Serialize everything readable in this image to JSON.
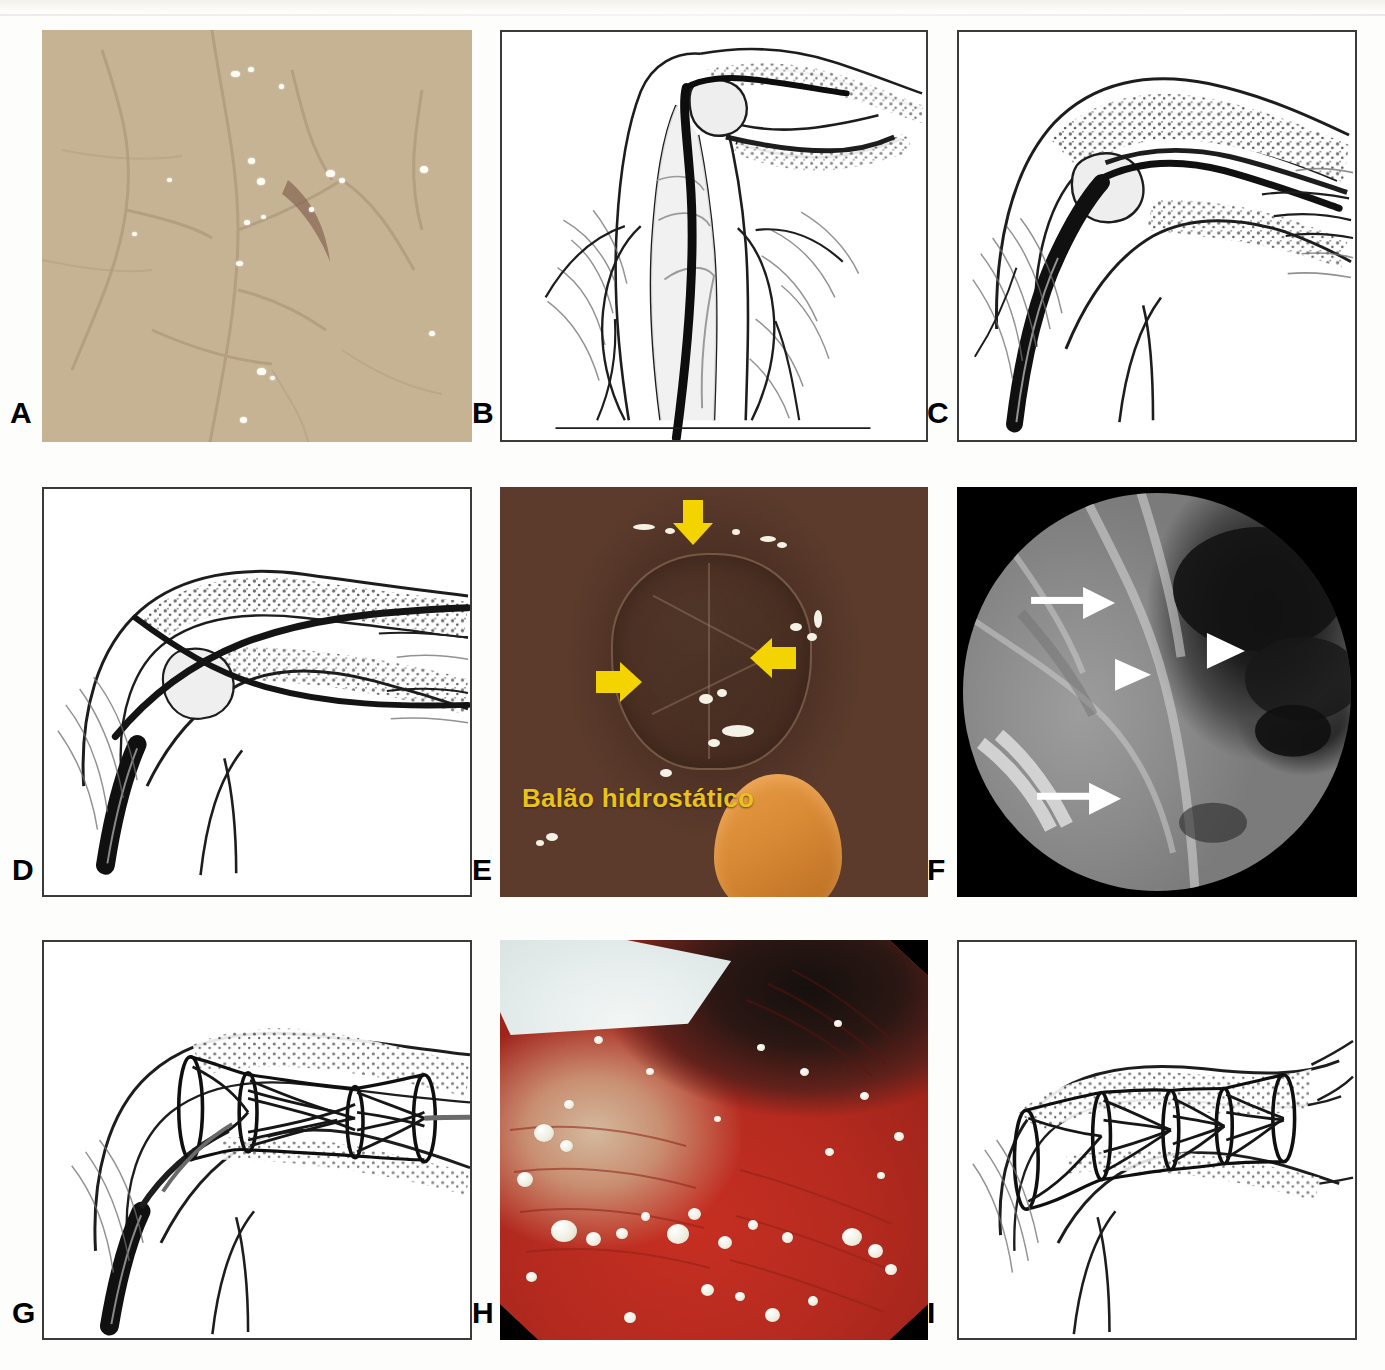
{
  "figure": {
    "layout": {
      "rows": 3,
      "columns": 3
    },
    "background_color": "#ffffff"
  },
  "panels": [
    {
      "id": "A",
      "label": "A",
      "kind": "endoscopic-photograph",
      "description": "Endoscopic view of pale tan duodenal mucosa with a central infiltrated papilla and scattered light reflections",
      "framed": false,
      "colors": {
        "mucosa": "#c5b394",
        "highlight": "#e7e2c4",
        "lumen": "#3c1912"
      }
    },
    {
      "id": "B",
      "label": "B",
      "kind": "line-art-illustration",
      "description": "Duodenoscope positioned at the major papilla with guidewire advanced into the bile duct",
      "framed": true,
      "colors": {
        "ink": "#1d1d1d",
        "paper": "#ffffff"
      }
    },
    {
      "id": "C",
      "label": "C",
      "kind": "line-art-illustration",
      "description": "Guidewire passed across the malignant biliary stricture into the proximal duct",
      "framed": true,
      "colors": {
        "ink": "#1d1d1d",
        "paper": "#ffffff"
      }
    },
    {
      "id": "D",
      "label": "D",
      "kind": "line-art-illustration",
      "description": "Catheter advanced over the guidewire through the stenosis",
      "framed": true,
      "colors": {
        "ink": "#1d1d1d",
        "paper": "#ffffff"
      }
    },
    {
      "id": "E",
      "label": "E",
      "kind": "endoscopic-photograph",
      "annotation_text": "Balão hidrostático",
      "annotation_color": "#e9c21c",
      "arrow_color": "#f3d400",
      "arrow_count": 3,
      "description": "Endoscopic image of the hydrostatic balloon inflated at the papilla, indicated by three yellow arrows",
      "framed": false,
      "colors": {
        "mucosa": "#563628",
        "scope": "#d98a35"
      }
    },
    {
      "id": "F",
      "label": "F",
      "kind": "fluoroscopy",
      "description": "Fluoroscopic cholangiogram showing the dilated bile duct; arrows mark the stricture margins and arrowheads the waist",
      "framed": false,
      "marker_color": "#ffffff",
      "arrow_count": 2,
      "arrowhead_count": 2,
      "colors": {
        "background": "#000000",
        "field": "#8f8f8f"
      }
    },
    {
      "id": "G",
      "label": "G",
      "kind": "line-art-illustration",
      "description": "Self-expandable metal stent partially deployed across the stricture over the delivery system",
      "framed": true,
      "colors": {
        "ink": "#1d1d1d",
        "paper": "#ffffff"
      }
    },
    {
      "id": "H",
      "label": "H",
      "kind": "endoscopic-photograph",
      "description": "Endoscopic view of erythematous mucosa with mucus bubbles and the white stent edge at upper left",
      "framed": false,
      "colors": {
        "mucosa": "#b8301f",
        "stent": "#eef3f2",
        "vignette": "#000000"
      }
    },
    {
      "id": "I",
      "label": "I",
      "kind": "line-art-illustration",
      "description": "Metal stent fully expanded across the biliary stricture after delivery system withdrawal",
      "framed": true,
      "colors": {
        "ink": "#1d1d1d",
        "paper": "#ffffff"
      }
    }
  ]
}
